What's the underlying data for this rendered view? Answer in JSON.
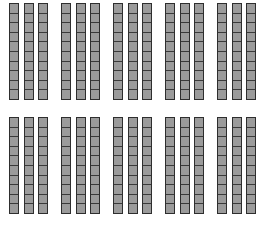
{
  "figure": {
    "rows": 2,
    "groups_per_row": 5,
    "rods_per_group": 3,
    "cells_per_rod": 10,
    "total_rods": 30,
    "total_value": 300,
    "colors": {
      "fill": "#9b9b9b",
      "border": "#2e2e2e",
      "background": "#ffffff"
    }
  }
}
